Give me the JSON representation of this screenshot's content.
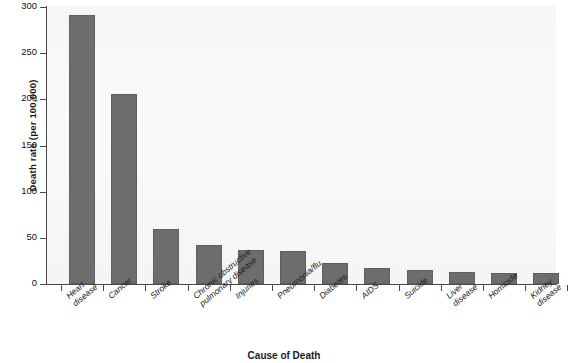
{
  "chart_data": {
    "type": "bar",
    "title": "",
    "xlabel": "Cause of Death",
    "ylabel": "Death rate (per 100,000)",
    "categories": [
      "Heart\ndisease",
      "Cancer",
      "Stroke",
      "Chronic obstructive\npulmonary disease",
      "Injuries",
      "Pneumonia/flu",
      "Diabetes",
      "AIDS",
      "Suicide",
      "Liver\ndisease",
      "Homicide",
      "Kidney\ndisease"
    ],
    "values": [
      291,
      206,
      60,
      42,
      37,
      36,
      23,
      17,
      15,
      13,
      12,
      12
    ],
    "ylim": [
      0,
      300
    ],
    "yticks": [
      0,
      50,
      100,
      150,
      200,
      250,
      300
    ],
    "ytick_labels": [
      "0",
      "50",
      "100",
      "150",
      "200",
      "250",
      "300"
    ],
    "grid": false,
    "legend": "none",
    "bar_color": "#6d6d6d",
    "plot_background": "#f7f7f7",
    "axis_color": "#4a4a4a"
  }
}
